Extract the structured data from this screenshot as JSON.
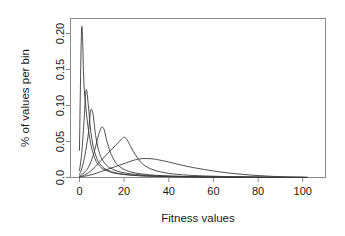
{
  "chart_data": {
    "type": "line",
    "title": "",
    "subtitle": "",
    "xlabel": "Fitness values",
    "ylabel": "% of values per bin",
    "xlim": [
      -4,
      110
    ],
    "ylim": [
      0.0,
      0.205
    ],
    "xticks": [
      0,
      20,
      40,
      60,
      80,
      100
    ],
    "xticklabels": [
      "0",
      "20",
      "40",
      "60",
      "80",
      "100"
    ],
    "yticks": [
      0.0,
      0.05,
      0.1,
      0.15,
      0.2
    ],
    "yticklabels": [
      "0.0",
      "0.05",
      "0.10",
      "0.15",
      "0.20"
    ],
    "grid": false,
    "legend": "none",
    "line_color": "#3a3a3a",
    "frame_color": "#8a8a8a",
    "background": "#ffffff",
    "series": [
      {
        "name": "curve-1",
        "x": [
          0,
          1,
          2,
          3,
          4,
          5,
          6,
          7,
          8,
          10,
          12,
          15,
          18,
          22,
          26,
          30,
          36,
          42,
          50,
          60,
          70,
          80,
          90,
          100,
          102
        ],
        "y": [
          0.035,
          0.193,
          0.122,
          0.086,
          0.062,
          0.044,
          0.032,
          0.024,
          0.018,
          0.012,
          0.009,
          0.006,
          0.0045,
          0.0032,
          0.0024,
          0.0018,
          0.0013,
          0.001,
          0.0007,
          0.0005,
          0.0003,
          0.0002,
          0.0001,
          0.0001,
          0.0
        ]
      },
      {
        "name": "curve-2",
        "x": [
          0,
          1,
          2,
          3,
          4,
          5,
          6,
          7,
          8,
          9,
          11,
          13,
          16,
          20,
          24,
          28,
          34,
          40,
          48,
          58,
          68,
          80,
          90,
          100,
          102
        ],
        "y": [
          0.009,
          0.031,
          0.071,
          0.113,
          0.092,
          0.061,
          0.042,
          0.031,
          0.023,
          0.018,
          0.012,
          0.009,
          0.006,
          0.0042,
          0.003,
          0.0022,
          0.0016,
          0.0012,
          0.0008,
          0.0005,
          0.0004,
          0.0002,
          0.0001,
          0.0001,
          0.0
        ]
      },
      {
        "name": "curve-3",
        "x": [
          0,
          1,
          2,
          3,
          4,
          5,
          6,
          7,
          8,
          9,
          10,
          12,
          14,
          17,
          21,
          25,
          30,
          36,
          44,
          54,
          66,
          78,
          90,
          100,
          102
        ],
        "y": [
          0.004,
          0.011,
          0.022,
          0.038,
          0.057,
          0.086,
          0.083,
          0.059,
          0.042,
          0.031,
          0.024,
          0.016,
          0.012,
          0.008,
          0.0055,
          0.004,
          0.0028,
          0.002,
          0.0014,
          0.0009,
          0.0006,
          0.0003,
          0.0002,
          0.0001,
          0.0
        ]
      },
      {
        "name": "curve-4",
        "x": [
          0,
          2,
          4,
          6,
          7,
          8,
          9,
          10,
          11,
          12,
          13,
          14,
          16,
          18,
          21,
          25,
          30,
          36,
          44,
          54,
          66,
          78,
          90,
          100,
          102
        ],
        "y": [
          0.002,
          0.006,
          0.013,
          0.027,
          0.037,
          0.049,
          0.059,
          0.065,
          0.062,
          0.05,
          0.04,
          0.031,
          0.02,
          0.014,
          0.009,
          0.0058,
          0.0038,
          0.0025,
          0.0016,
          0.001,
          0.0006,
          0.0004,
          0.0002,
          0.0001,
          0.0
        ]
      },
      {
        "name": "curve-5",
        "x": [
          0,
          2,
          4,
          6,
          8,
          10,
          12,
          14,
          16,
          18,
          19,
          20,
          21,
          22,
          24,
          26,
          28,
          32,
          38,
          46,
          56,
          68,
          80,
          92,
          102
        ],
        "y": [
          0.001,
          0.003,
          0.006,
          0.011,
          0.017,
          0.023,
          0.029,
          0.035,
          0.041,
          0.047,
          0.05,
          0.052,
          0.05,
          0.045,
          0.034,
          0.025,
          0.018,
          0.011,
          0.0062,
          0.0035,
          0.002,
          0.0011,
          0.0006,
          0.0003,
          0.0
        ]
      },
      {
        "name": "curve-6",
        "x": [
          0,
          3,
          6,
          9,
          12,
          15,
          18,
          21,
          24,
          26,
          28,
          30,
          32,
          34,
          38,
          42,
          48,
          54,
          62,
          70,
          78,
          86,
          94,
          100,
          102
        ],
        "y": [
          0.0008,
          0.002,
          0.004,
          0.007,
          0.01,
          0.013,
          0.016,
          0.019,
          0.022,
          0.0235,
          0.0243,
          0.0245,
          0.0242,
          0.0235,
          0.0212,
          0.0185,
          0.0145,
          0.0112,
          0.0075,
          0.0048,
          0.0028,
          0.0015,
          0.0007,
          0.0003,
          0.0
        ]
      }
    ]
  },
  "axes": {
    "x_title": "Fitness values",
    "y_title": "% of values per bin"
  }
}
